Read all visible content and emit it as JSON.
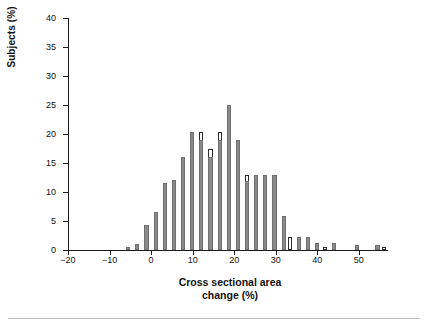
{
  "chart_data": {
    "type": "bar",
    "title": "",
    "subtitle": "",
    "xlabel_line1": "Cross sectional area",
    "xlabel_line2": "change (%)",
    "ylabel": "Subjects (%)",
    "xlim": [
      -20,
      57
    ],
    "ylim": [
      0,
      40
    ],
    "yticks": [
      0,
      5,
      10,
      15,
      20,
      25,
      30,
      35,
      40
    ],
    "ytick_labels": [
      "0",
      "5",
      "10",
      "15",
      "20",
      "25",
      "30",
      "35",
      "40"
    ],
    "xticks": [
      -20,
      -10,
      0,
      10,
      20,
      30,
      40,
      50
    ],
    "xtick_labels": [
      "−20",
      "−10",
      "0",
      "10",
      "20",
      "30",
      "40",
      "50"
    ],
    "grid": false,
    "legend_position": "none",
    "colors": {
      "filled_bar": "#8a8a8a",
      "open_bar": "#ffffff",
      "open_bar_edge": "#2b2b2b",
      "axis": "#1a1a1a",
      "text": "#111111",
      "background": "#ffffff",
      "bottom_rule": "#bfbfbf"
    },
    "series": [
      {
        "name": "filled",
        "style": "filled",
        "points": [
          {
            "x": -6.0,
            "value": 0.6
          },
          {
            "x": -3.8,
            "value": 1.0
          },
          {
            "x": -1.6,
            "value": 4.3
          },
          {
            "x": 0.6,
            "value": 6.5
          },
          {
            "x": 2.8,
            "value": 11.5
          },
          {
            "x": 5.0,
            "value": 12.0
          },
          {
            "x": 7.2,
            "value": 16.1
          },
          {
            "x": 9.4,
            "value": 20.4
          },
          {
            "x": 11.6,
            "value": 19.0
          },
          {
            "x": 13.8,
            "value": 16.0
          },
          {
            "x": 16.0,
            "value": 19.0
          },
          {
            "x": 18.2,
            "value": 25.0
          },
          {
            "x": 20.4,
            "value": 19.0
          },
          {
            "x": 22.6,
            "value": 11.9
          },
          {
            "x": 24.8,
            "value": 13.0
          },
          {
            "x": 27.0,
            "value": 13.0
          },
          {
            "x": 29.2,
            "value": 13.0
          },
          {
            "x": 31.4,
            "value": 5.8
          },
          {
            "x": 35.0,
            "value": 2.3
          },
          {
            "x": 37.2,
            "value": 2.3
          },
          {
            "x": 39.4,
            "value": 1.2
          },
          {
            "x": 43.5,
            "value": 1.2
          },
          {
            "x": 49.0,
            "value": 0.9
          },
          {
            "x": 54.0,
            "value": 0.9
          }
        ]
      },
      {
        "name": "open",
        "style": "open",
        "points": [
          {
            "x": -3.8,
            "value": 1.0
          },
          {
            "x": -1.6,
            "value": 1.7
          },
          {
            "x": 0.6,
            "value": 6.5
          },
          {
            "x": 2.8,
            "value": 11.5
          },
          {
            "x": 5.0,
            "value": 12.0
          },
          {
            "x": 7.2,
            "value": 13.2
          },
          {
            "x": 9.4,
            "value": 20.4
          },
          {
            "x": 11.6,
            "value": 20.4
          },
          {
            "x": 13.8,
            "value": 17.5
          },
          {
            "x": 16.0,
            "value": 20.4
          },
          {
            "x": 18.2,
            "value": 20.4
          },
          {
            "x": 20.4,
            "value": 19.0
          },
          {
            "x": 22.6,
            "value": 13.0
          },
          {
            "x": 24.8,
            "value": 13.0
          },
          {
            "x": 27.0,
            "value": 13.0
          },
          {
            "x": 29.2,
            "value": 5.8
          },
          {
            "x": 33.0,
            "value": 2.3
          },
          {
            "x": 37.2,
            "value": 1.0
          },
          {
            "x": 41.4,
            "value": 0.5
          },
          {
            "x": 55.5,
            "value": 0.6
          }
        ]
      }
    ]
  },
  "axis_titles": {
    "x_line1": "Cross sectional area",
    "x_line2": "change (%)",
    "y": "Subjects (%)"
  }
}
